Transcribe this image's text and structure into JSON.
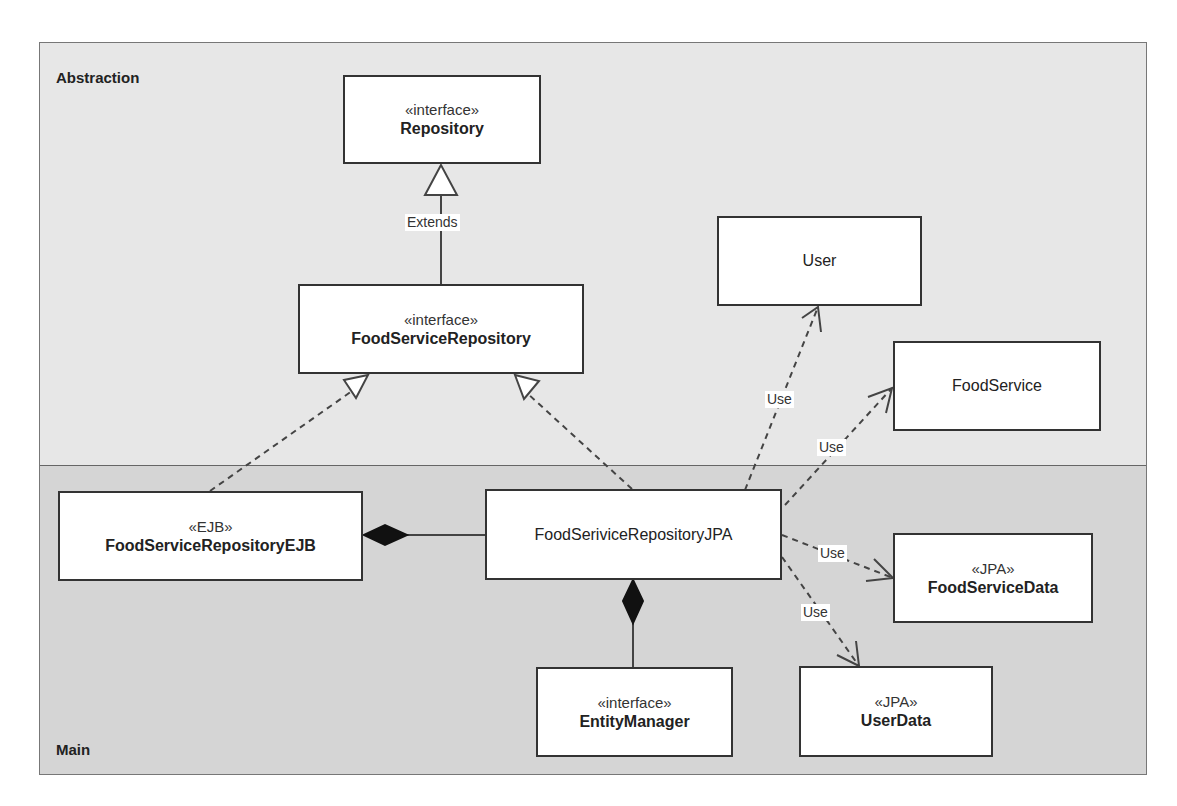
{
  "regions": {
    "abstraction": {
      "label": "Abstraction",
      "bg": "#e7e7e7"
    },
    "main": {
      "label": "Main",
      "bg": "#d5d5d5"
    }
  },
  "classes": {
    "repository": {
      "stereotype": "«interface»",
      "name": "Repository"
    },
    "food_service_repository": {
      "stereotype": "«interface»",
      "name": "FoodServiceRepository"
    },
    "user": {
      "name": "User"
    },
    "food_service": {
      "name": "FoodService"
    },
    "food_service_repository_ejb": {
      "stereotype": "«EJB»",
      "name": "FoodServiceRepositoryEJB"
    },
    "food_service_repository_jpa": {
      "name": "FoodSeriviceRepositoryJPA"
    },
    "food_service_data": {
      "stereotype": "«JPA»",
      "name": "FoodServiceData"
    },
    "entity_manager": {
      "stereotype": "«interface»",
      "name": "EntityManager"
    },
    "user_data": {
      "stereotype": "«JPA»",
      "name": "UserData"
    }
  },
  "relations": [
    {
      "type": "generalization",
      "from": "FoodServiceRepository",
      "to": "Repository",
      "label": "Extends"
    },
    {
      "type": "realization",
      "from": "FoodServiceRepositoryEJB",
      "to": "FoodServiceRepository"
    },
    {
      "type": "realization",
      "from": "FoodSeriviceRepositoryJPA",
      "to": "FoodServiceRepository"
    },
    {
      "type": "composition",
      "from": "FoodServiceRepositoryEJB",
      "to": "FoodSeriviceRepositoryJPA"
    },
    {
      "type": "composition",
      "from": "FoodSeriviceRepositoryJPA",
      "to": "EntityManager"
    },
    {
      "type": "dependency",
      "from": "FoodSeriviceRepositoryJPA",
      "to": "User",
      "label": "Use"
    },
    {
      "type": "dependency",
      "from": "FoodSeriviceRepositoryJPA",
      "to": "FoodService",
      "label": "Use"
    },
    {
      "type": "dependency",
      "from": "FoodSeriviceRepositoryJPA",
      "to": "FoodServiceData",
      "label": "Use"
    },
    {
      "type": "dependency",
      "from": "FoodSeriviceRepositoryJPA",
      "to": "UserData",
      "label": "Use"
    }
  ],
  "labels": {
    "extends": "Extends",
    "use_user": "Use",
    "use_food_service": "Use",
    "use_food_service_data": "Use",
    "use_user_data": "Use"
  }
}
